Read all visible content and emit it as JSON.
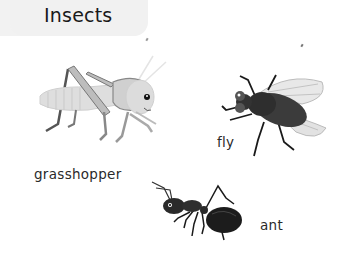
{
  "page": {
    "title": "Insects"
  },
  "insects": [
    {
      "name": "grasshopper",
      "label": "grasshopper",
      "icon": "grasshopper-illustration"
    },
    {
      "name": "fly",
      "label": "fly",
      "icon": "fly-illustration"
    },
    {
      "name": "ant",
      "label": "ant",
      "icon": "ant-illustration"
    }
  ],
  "colors": {
    "banner_bg": "#f1f1f1",
    "text": "#1a1a1a",
    "grasshopper_body": "#d9d9d9",
    "fly_body": "#3a3a3a",
    "ant_body": "#1c1c1c"
  }
}
